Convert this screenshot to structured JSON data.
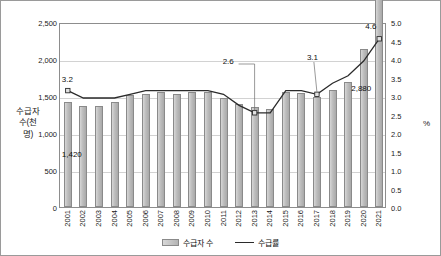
{
  "axis": {
    "left_title": "수급자 수(천명)",
    "right_title": "%",
    "left_ticks": [
      "2,500",
      "2,000",
      "1,500",
      "1,000",
      "500",
      "0"
    ],
    "right_ticks": [
      "5.0",
      "4.5",
      "4.0",
      "3.5",
      "3.0",
      "2.5",
      "2.0",
      "1.5",
      "1.0",
      "0.5",
      "0.0"
    ]
  },
  "legend": {
    "bar_label": "수급자 수",
    "line_label": "수급률"
  },
  "annotations": {
    "first_bar_value": "1,420",
    "last_bar_value": "2,880",
    "line_start": "3.2",
    "line_dip": "2.6",
    "line_mid": "3.1",
    "line_end": "4.6"
  },
  "colors": {
    "bar_fill": "#bdbdbd",
    "bar_border": "#8a8a8a",
    "line": "#2b2b2b",
    "grid": "#d2d2d2",
    "frame": "#9a9a9a",
    "text": "#1a1a1a"
  },
  "chart_data": {
    "type": "bar",
    "title": "",
    "xlabel": "",
    "ylabel": "수급자 수(천명)",
    "y2label": "%",
    "ylim": [
      0,
      2500
    ],
    "y2lim": [
      0,
      5.0
    ],
    "grid": true,
    "legend_position": "bottom",
    "categories": [
      "2001",
      "2002",
      "2003",
      "2004",
      "2005",
      "2006",
      "2007",
      "2008",
      "2009",
      "2010",
      "2011",
      "2012",
      "2013",
      "2014",
      "2015",
      "2016",
      "2017",
      "2018",
      "2019",
      "2020",
      "2021"
    ],
    "series": [
      {
        "name": "수급자 수",
        "type": "bar",
        "axis": "left",
        "unit": "천 명",
        "values": [
          1420,
          1370,
          1360,
          1420,
          1510,
          1530,
          1550,
          1530,
          1560,
          1550,
          1470,
          1390,
          1350,
          1330,
          1550,
          1540,
          1490,
          1580,
          1690,
          2130,
          2880
        ],
        "labels": {
          "2001": "1,420",
          "2021": "2,880"
        }
      },
      {
        "name": "수급률",
        "type": "line",
        "axis": "right",
        "unit": "%",
        "values": [
          3.2,
          3.0,
          3.0,
          3.0,
          3.1,
          3.2,
          3.2,
          3.2,
          3.2,
          3.2,
          3.1,
          2.8,
          2.6,
          2.6,
          3.2,
          3.2,
          3.1,
          3.4,
          3.6,
          4.0,
          4.6
        ],
        "labels": {
          "2001": "3.2",
          "2013": "2.6",
          "2017": "3.1",
          "2021": "4.6"
        }
      }
    ]
  }
}
